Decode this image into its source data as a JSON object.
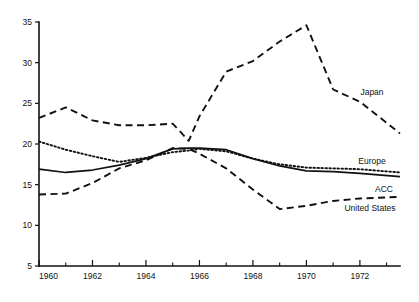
{
  "chart_data": {
    "type": "line",
    "title": "",
    "subtitle": "",
    "xlabel": "",
    "ylabel": "",
    "xlim": [
      1960,
      1973.5
    ],
    "ylim": [
      5,
      35
    ],
    "grid": false,
    "legend_position": "right-inline-labels",
    "y_ticks": [
      5,
      10,
      15,
      20,
      25,
      30,
      35
    ],
    "y_tick_labels": [
      "5",
      "10",
      "15",
      "20",
      "25",
      "30",
      "35"
    ],
    "x_ticks": [
      1960,
      1961,
      1962,
      1963,
      1964,
      1965,
      1966,
      1967,
      1968,
      1969,
      1970,
      1971,
      1972,
      1973
    ],
    "x_tick_labels_major": [
      "1960",
      "1962",
      "1964",
      "1966",
      "1968",
      "1970",
      "1972"
    ],
    "x_major_ticks": [
      1960,
      1962,
      1964,
      1966,
      1968,
      1970,
      1972
    ],
    "x": [
      1960,
      1961,
      1962,
      1963,
      1964,
      1965,
      1965.6,
      1966,
      1967,
      1968,
      1969,
      1970,
      1971,
      1972,
      1973.5
    ],
    "series": [
      {
        "name": "Japan",
        "style": "dashed",
        "label": "Japan",
        "values": [
          23.2,
          24.5,
          22.9,
          22.3,
          22.3,
          22.5,
          20.4,
          23.4,
          28.9,
          30.2,
          32.6,
          34.6,
          26.7,
          25.2,
          21.3
        ]
      },
      {
        "name": "Europe",
        "style": "dotted",
        "label": "Europe",
        "values": [
          20.3,
          19.3,
          18.5,
          17.8,
          18.3,
          19.0,
          19.2,
          19.4,
          19.1,
          18.2,
          17.5,
          17.1,
          17.0,
          16.9,
          16.5
        ]
      },
      {
        "name": "ACC",
        "style": "solid",
        "label": "ACC",
        "values": [
          16.9,
          16.5,
          16.8,
          17.4,
          18.2,
          19.4,
          19.5,
          19.5,
          19.3,
          18.2,
          17.3,
          16.7,
          16.6,
          16.4,
          16.0
        ]
      },
      {
        "name": "United States",
        "style": "dashed",
        "label": "United States",
        "values": [
          13.8,
          13.9,
          15.2,
          17.0,
          18.0,
          19.5,
          19.4,
          18.8,
          17.0,
          14.4,
          12.0,
          12.4,
          13.0,
          13.3,
          13.5
        ]
      }
    ]
  }
}
